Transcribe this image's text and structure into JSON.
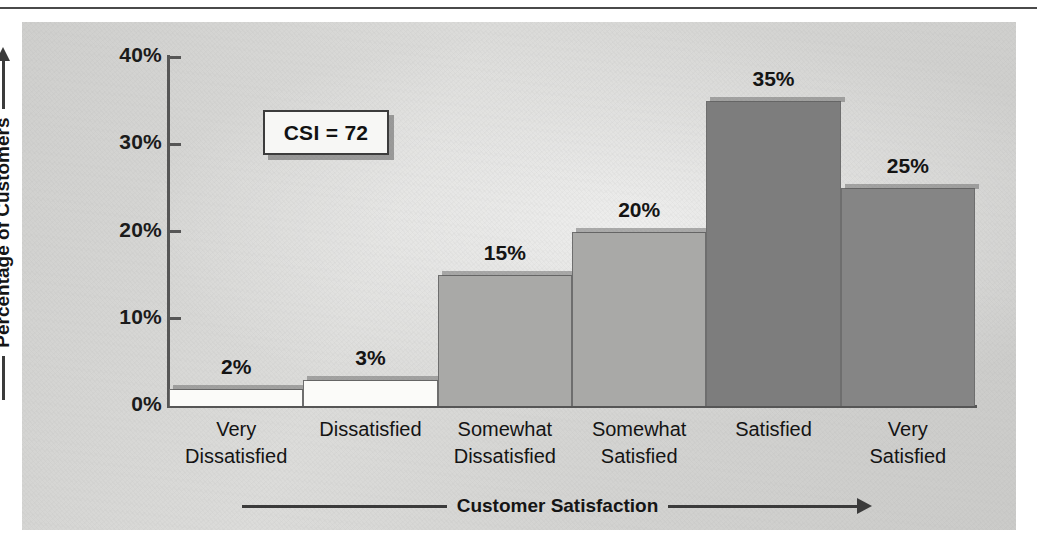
{
  "chart_data": {
    "type": "bar",
    "title": "",
    "xlabel": "Customer Satisfaction",
    "ylabel": "Percentage of Customers",
    "categories": [
      "Very\nDissatisfied",
      "Dissatisfied",
      "Somewhat\nDissatisfied",
      "Somewhat\nSatisfied",
      "Satisfied",
      "Very\nSatisfied"
    ],
    "values": [
      2,
      3,
      15,
      20,
      35,
      25
    ],
    "value_labels": [
      "2%",
      "3%",
      "15%",
      "20%",
      "35%",
      "25%"
    ],
    "bar_colors": [
      "#fbfbf9",
      "#fbfbf9",
      "#a9a9a7",
      "#a9a9a7",
      "#7d7d7d",
      "#858585"
    ],
    "ylim": [
      0,
      40
    ],
    "yticks": [
      0,
      10,
      20,
      30,
      40
    ],
    "ytick_labels": [
      "0%",
      "10%",
      "20%",
      "30%",
      "40%"
    ],
    "grid": false,
    "legend": false,
    "annotation": {
      "label": "CSI = 72"
    }
  },
  "axes": {
    "y_axis_title": "Percentage of Customers",
    "x_axis_title": "Customer Satisfaction"
  },
  "colors": {
    "panel": "#d6d6d4",
    "axis": "#565656",
    "text": "#141414",
    "bar_light": "#fbfbf9",
    "bar_mid": "#a9a9a7",
    "bar_dark": "#7d7d7d"
  }
}
